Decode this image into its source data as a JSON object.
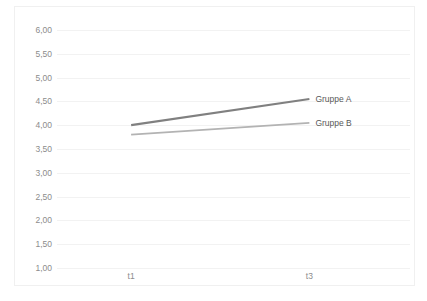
{
  "chart_data": {
    "type": "line",
    "title": "",
    "xlabel": "",
    "ylabel": "",
    "categories": [
      "t1",
      "t3"
    ],
    "x_tick_labels": [
      "t1",
      "t3"
    ],
    "y_tick_labels": [
      "6,00",
      "5,50",
      "5,00",
      "4,50",
      "4,00",
      "3,50",
      "3,00",
      "2,50",
      "2,00",
      "1,50",
      "1,00"
    ],
    "y_tick_values": [
      6.0,
      5.5,
      5.0,
      4.5,
      4.0,
      3.5,
      3.0,
      2.5,
      2.0,
      1.5,
      1.0
    ],
    "ylim": [
      1.0,
      6.0
    ],
    "y_step": 0.5,
    "grid": "horizontal",
    "legend_position": "line-end-labels",
    "decimal_separator": ",",
    "series": [
      {
        "name": "Gruppe A",
        "values": [
          4.0,
          4.55
        ],
        "color": "#808080",
        "line_width": 2.2
      },
      {
        "name": "Gruppe B",
        "values": [
          3.8,
          4.05
        ],
        "color": "#b3b3b3",
        "line_width": 1.8
      }
    ]
  },
  "colors": {
    "background": "#ffffff",
    "frame": "#f0f0f0",
    "gridline": "#f2f2f2",
    "tick_text": "#8c8c8c",
    "series_label_text": "#595959",
    "series_a": "#808080",
    "series_b": "#b3b3b3"
  }
}
